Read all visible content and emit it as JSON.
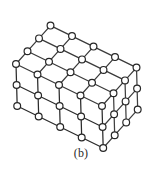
{
  "figure": {
    "caption": "(b)",
    "kind": "3d-lattice-parallelepiped",
    "colors": {
      "background": "#ffffff",
      "bond_stroke": "#2f2f2f",
      "atom_stroke": "#262626",
      "atom_fill": "#ffffff",
      "caption_text": "#2b2b2b"
    },
    "geometry": {
      "counts": {
        "nx": 5,
        "ny": 4,
        "nz": 3
      },
      "origin": {
        "x": 16,
        "y": 64
      },
      "vec_a": {
        "x": 21.5,
        "y": 10.5
      },
      "vec_b": {
        "x": 11.5,
        "y": -12.8
      },
      "vec_c": {
        "x": 0.6,
        "y": 21.0
      },
      "atom_radius": 3.4,
      "bond_width": 1.25,
      "atom_stroke_width": 1.2
    },
    "bond_shading": {
      "top_face": "#3a3a3a",
      "front_face": "#2b2b2b",
      "side_face": "#3f3f3f",
      "interior": "#6d6d6d"
    }
  }
}
